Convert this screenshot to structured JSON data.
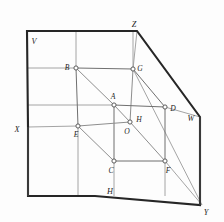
{
  "figure": {
    "background_color": "#fdfdfd",
    "outline_color": "#262626",
    "cube_edge_color": "#8e8e8e",
    "vertex_fill_color": "#ffffff",
    "vertex_stroke_color": "#5c5c5c"
  },
  "plane_outline": {
    "name": "projection-planes-outline",
    "points": "27,31 137,31 200,117 200,205 202,205 95,196 28,196 28,127 27,31"
  },
  "corner_labels": [
    {
      "id": "V",
      "text": "V",
      "x": 33,
      "y": 42
    },
    {
      "id": "Z",
      "text": "Z",
      "x": 134,
      "y": 26
    },
    {
      "id": "W",
      "text": "W",
      "x": 191,
      "y": 119
    },
    {
      "id": "X",
      "text": "X",
      "x": 17,
      "y": 131
    },
    {
      "id": "H",
      "text": "H",
      "x": 110,
      "y": 196
    },
    {
      "id": "Y",
      "text": "Y",
      "x": 205,
      "y": 214
    }
  ],
  "cube_vertices": [
    {
      "id": "B",
      "label": "B",
      "x": 76,
      "y": 68,
      "label_x": 67,
      "label_y": 68
    },
    {
      "id": "G",
      "label": "G",
      "x": 133,
      "y": 69,
      "label_x": 138,
      "label_y": 69
    },
    {
      "id": "A",
      "label": "A",
      "x": 114,
      "y": 105,
      "label_x": 111,
      "label_y": 98
    },
    {
      "id": "D",
      "label": "D",
      "x": 165,
      "y": 107,
      "label_x": 170,
      "label_y": 109
    },
    {
      "id": "E",
      "label": "E",
      "x": 78,
      "y": 126,
      "label_x": 76,
      "label_y": 136
    },
    {
      "id": "O",
      "label": "O",
      "x": 130,
      "y": 122,
      "label_x": 125,
      "label_y": 133
    },
    {
      "id": "H",
      "label": "H",
      "x": 130,
      "y": 122,
      "label_x": 136,
      "label_y": 121
    },
    {
      "id": "C",
      "label": "C",
      "x": 114,
      "y": 161,
      "label_x": 110,
      "label_y": 171
    },
    {
      "id": "F",
      "label": "F",
      "x": 165,
      "y": 161,
      "label_x": 168,
      "label_y": 171
    }
  ],
  "cube_edges": [
    {
      "from": "B",
      "to": "G"
    },
    {
      "from": "B",
      "to": "E"
    },
    {
      "from": "B",
      "to": "A"
    },
    {
      "from": "G",
      "to": "D"
    },
    {
      "from": "G",
      "to": "O"
    },
    {
      "from": "A",
      "to": "D"
    },
    {
      "from": "A",
      "to": "O"
    },
    {
      "from": "A",
      "to": "C"
    },
    {
      "from": "E",
      "to": "O"
    },
    {
      "from": "E",
      "to": "C"
    },
    {
      "from": "D",
      "to": "F"
    },
    {
      "from": "O",
      "to": "F"
    },
    {
      "from": "C",
      "to": "F"
    }
  ],
  "projection_lines": [
    {
      "name": "ray-Z-to-G",
      "x1": 137,
      "y1": 31,
      "x2": 133,
      "y2": 69
    },
    {
      "name": "ray-G-to-Y",
      "x1": 133,
      "y1": 69,
      "x2": 202,
      "y2": 205
    },
    {
      "name": "ray-X-to-E",
      "x1": 28,
      "y1": 127,
      "x2": 78,
      "y2": 126
    },
    {
      "name": "ray-D-to-W",
      "x1": 165,
      "y1": 107,
      "x2": 200,
      "y2": 117
    },
    {
      "name": "ray-F-to-Y",
      "x1": 165,
      "y1": 161,
      "x2": 202,
      "y2": 205
    },
    {
      "name": "ray-C-down",
      "x1": 114,
      "y1": 161,
      "x2": 114,
      "y2": 196
    },
    {
      "name": "ray-F-down",
      "x1": 165,
      "y1": 161,
      "x2": 165,
      "y2": 196
    },
    {
      "name": "ray-B-up",
      "x1": 76,
      "y1": 68,
      "x2": 76,
      "y2": 31
    },
    {
      "name": "ray-G-up",
      "x1": 133,
      "y1": 69,
      "x2": 133,
      "y2": 31
    },
    {
      "name": "ray-B-left",
      "x1": 28,
      "y1": 68,
      "x2": 76,
      "y2": 68
    },
    {
      "name": "ray-A-left",
      "x1": 28,
      "y1": 105,
      "x2": 114,
      "y2": 105
    },
    {
      "name": "ray-E-down",
      "x1": 78,
      "y1": 126,
      "x2": 78,
      "y2": 196
    }
  ]
}
